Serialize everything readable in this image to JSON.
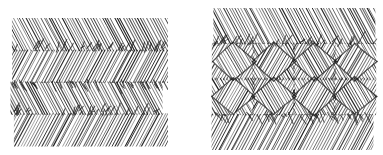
{
  "page": {
    "background_color": "#ffffff",
    "ink_color": "#1a1a1a",
    "width": 383,
    "height": 155
  },
  "figures": [
    {
      "id": "left-figure",
      "name": "herringbone-hatch-swatch",
      "pattern": "herringbone",
      "description": "Horizontal bands of dense parallel pen strokes that alternate diagonal direction band to band, forming chevron seams",
      "bounds": {
        "x": 12,
        "y": 18,
        "width": 153,
        "height": 127
      },
      "band_count": 4,
      "band_height": 32,
      "stroke_angle_deg": 62,
      "stroke_spacing": 2.6,
      "stroke_width": 0.85,
      "ink_color": "#1d1d1d"
    },
    {
      "id": "right-figure",
      "name": "basketweave-diamond-lattice-swatch",
      "pattern": "interlaced-diamond-lattice",
      "description": "Central interlaced basket-weave of diamond cells built from crossing hatched bands, bordered above and below by plain diagonal hatch bands running in opposite directions",
      "bounds": {
        "x": 213,
        "y": 8,
        "width": 162,
        "height": 142
      },
      "top_band": {
        "label": "plain-diagonal-hatch-top",
        "angle_deg": 62,
        "height": 36
      },
      "middle_band": {
        "label": "interlaced-diamond-lattice",
        "height": 70,
        "diamond_columns": 4,
        "diamond_rows": 2,
        "cell_width": 42,
        "cell_height": 36
      },
      "bottom_band": {
        "label": "plain-diagonal-hatch-bottom",
        "angle_deg": -62,
        "height": 36
      },
      "stroke_spacing": 2.6,
      "stroke_width": 0.85,
      "ink_color": "#1d1d1d"
    }
  ],
  "chart_data": {
    "type": "table",
    "categories": [
      "left swatch",
      "right swatch"
    ],
    "values": [
      "herringbone hatch: 4 alternating diagonal bands",
      "interlaced diamond lattice with plain diagonal hatch bands top and bottom"
    ],
    "xlabel": "",
    "ylabel": "",
    "grid": false,
    "legend": "none"
  }
}
